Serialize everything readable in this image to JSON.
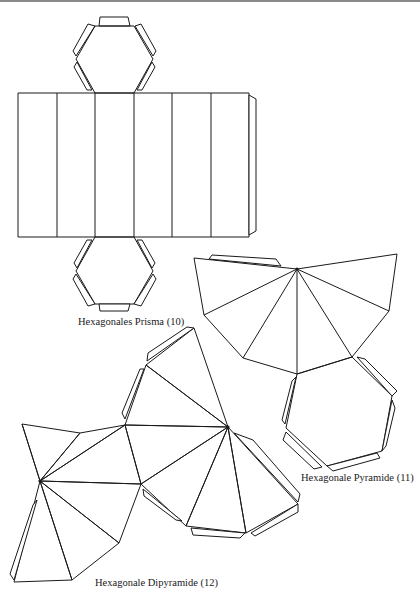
{
  "figure": {
    "nets": [
      {
        "id": "prism",
        "label": "Hexagonales Prisma (10)",
        "number": 10,
        "faces": {
          "rectangles": 6,
          "hexagons": 2
        }
      },
      {
        "id": "pyramid",
        "label": "Hexagonale Pyramide (11)",
        "number": 11,
        "faces": {
          "triangles": 6,
          "hexagons": 1
        }
      },
      {
        "id": "dipyramid",
        "label": "Hexagonale Dipyramide (12)",
        "number": 12,
        "faces": {
          "triangles": 12
        }
      }
    ],
    "colors": {
      "line": "#1a1a1a",
      "background": "#ffffff",
      "top_rule": "#8a8a8a"
    }
  }
}
